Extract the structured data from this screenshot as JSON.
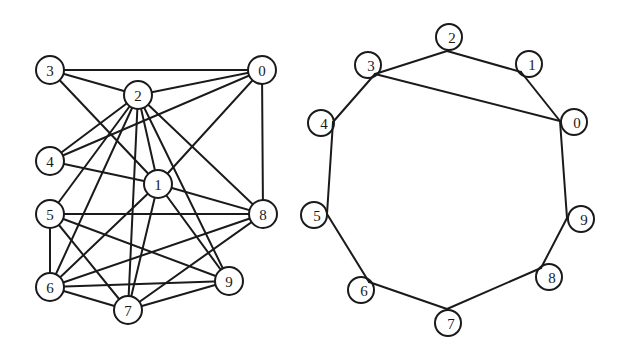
{
  "colors": {
    "ink": "#1a1a1a",
    "background": "#ffffff"
  },
  "left_graph": {
    "node_radius": 14,
    "nodes": [
      {
        "id": "0",
        "label": "0",
        "x": 262,
        "y": 70
      },
      {
        "id": "1",
        "label": "1",
        "x": 158,
        "y": 184
      },
      {
        "id": "2",
        "label": "2",
        "x": 138,
        "y": 95
      },
      {
        "id": "3",
        "label": "3",
        "x": 50,
        "y": 70
      },
      {
        "id": "4",
        "label": "4",
        "x": 50,
        "y": 161
      },
      {
        "id": "5",
        "label": "5",
        "x": 50,
        "y": 214
      },
      {
        "id": "6",
        "label": "6",
        "x": 50,
        "y": 287
      },
      {
        "id": "7",
        "label": "7",
        "x": 128,
        "y": 310
      },
      {
        "id": "8",
        "label": "8",
        "x": 263,
        "y": 214
      },
      {
        "id": "9",
        "label": "9",
        "x": 229,
        "y": 281
      }
    ],
    "edges": [
      [
        "3",
        "0"
      ],
      [
        "3",
        "2"
      ],
      [
        "3",
        "1"
      ],
      [
        "2",
        "0"
      ],
      [
        "2",
        "4"
      ],
      [
        "2",
        "1"
      ],
      [
        "2",
        "5"
      ],
      [
        "2",
        "6"
      ],
      [
        "2",
        "7"
      ],
      [
        "2",
        "8"
      ],
      [
        "2",
        "9"
      ],
      [
        "0",
        "4"
      ],
      [
        "0",
        "1"
      ],
      [
        "0",
        "8"
      ],
      [
        "4",
        "1"
      ],
      [
        "1",
        "6"
      ],
      [
        "1",
        "7"
      ],
      [
        "1",
        "8"
      ],
      [
        "1",
        "9"
      ],
      [
        "5",
        "8"
      ],
      [
        "5",
        "9"
      ],
      [
        "5",
        "6"
      ],
      [
        "5",
        "7"
      ],
      [
        "6",
        "8"
      ],
      [
        "6",
        "9"
      ],
      [
        "6",
        "7"
      ],
      [
        "7",
        "8"
      ],
      [
        "7",
        "9"
      ]
    ]
  },
  "right_graph": {
    "node_radius": 13,
    "nodes": [
      {
        "id": "0",
        "label": "0",
        "vx": 560,
        "vy": 121,
        "cx": 574,
        "cy": 122
      },
      {
        "id": "1",
        "label": "1",
        "vx": 521,
        "vy": 72,
        "cx": 529,
        "cy": 64
      },
      {
        "id": "2",
        "label": "2",
        "vx": 447,
        "vy": 51,
        "cx": 449,
        "cy": 37
      },
      {
        "id": "3",
        "label": "3",
        "vx": 375,
        "vy": 74,
        "cx": 368,
        "cy": 65
      },
      {
        "id": "4",
        "label": "4",
        "vx": 333,
        "vy": 122,
        "cx": 321,
        "cy": 123
      },
      {
        "id": "5",
        "label": "5",
        "vx": 327,
        "vy": 214,
        "cx": 314,
        "cy": 215
      },
      {
        "id": "6",
        "label": "6",
        "vx": 369,
        "vy": 282,
        "cx": 361,
        "cy": 290
      },
      {
        "id": "7",
        "label": "7",
        "vx": 447,
        "vy": 309,
        "cx": 448,
        "cy": 323
      },
      {
        "id": "8",
        "label": "8",
        "vx": 541,
        "vy": 268,
        "cx": 549,
        "cy": 277
      },
      {
        "id": "9",
        "label": "9",
        "vx": 567,
        "vy": 218,
        "cx": 581,
        "cy": 219
      }
    ],
    "edges": [
      [
        "3",
        "2"
      ],
      [
        "2",
        "1"
      ],
      [
        "1",
        "0"
      ],
      [
        "3",
        "0"
      ],
      [
        "3",
        "4"
      ],
      [
        "4",
        "5"
      ],
      [
        "5",
        "6"
      ],
      [
        "6",
        "7"
      ],
      [
        "7",
        "8"
      ],
      [
        "8",
        "9"
      ],
      [
        "9",
        "0"
      ]
    ]
  }
}
